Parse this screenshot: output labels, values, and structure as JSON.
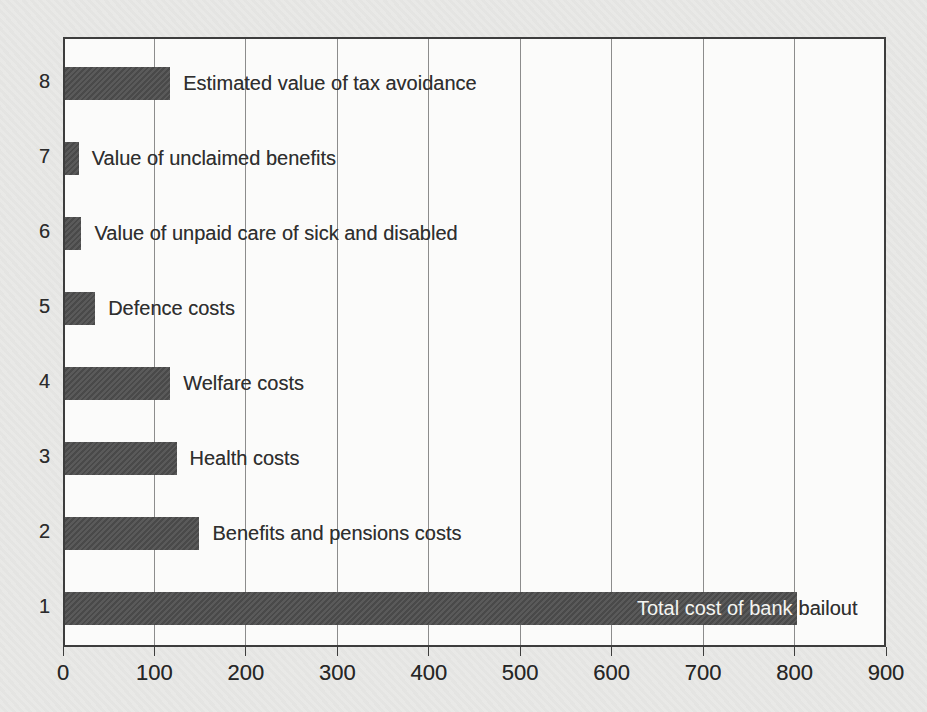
{
  "chart_data": {
    "type": "bar",
    "orientation": "horizontal",
    "title": "",
    "xlabel": "",
    "ylabel": "",
    "xlim": [
      0,
      900
    ],
    "x_ticks": [
      0,
      100,
      200,
      300,
      400,
      500,
      600,
      700,
      800,
      900
    ],
    "grid": "vertical-gridlines-on",
    "legend": "none",
    "rows": [
      {
        "category": "8",
        "label": "Estimated value of tax avoidance",
        "value": 115,
        "label_placement": "right"
      },
      {
        "category": "7",
        "label": "Value of unclaimed benefits",
        "value": 15,
        "label_placement": "right"
      },
      {
        "category": "6",
        "label": "Value of unpaid care of sick and disabled",
        "value": 18,
        "label_placement": "right"
      },
      {
        "category": "5",
        "label": "Defence costs",
        "value": 33,
        "label_placement": "right"
      },
      {
        "category": "4",
        "label": "Welfare costs",
        "value": 115,
        "label_placement": "right"
      },
      {
        "category": "3",
        "label": "Health costs",
        "value": 122,
        "label_placement": "right"
      },
      {
        "category": "2",
        "label": "Benefits and pensions costs",
        "value": 147,
        "label_placement": "right"
      },
      {
        "category": "1",
        "label": "Total cost of bank bailout",
        "value": 800,
        "label_placement": "inside"
      }
    ],
    "colors": {
      "bar": "#4e4e4e",
      "plot_background": "#fbfbfa",
      "page_background": "#e8e8e6",
      "gridline": "#8c8c8c",
      "frame": "#3d3d3d",
      "axis_text": "#262626",
      "bar_label_text": "#2f2f2f",
      "inside_label_text": "#f4f4f1"
    }
  }
}
